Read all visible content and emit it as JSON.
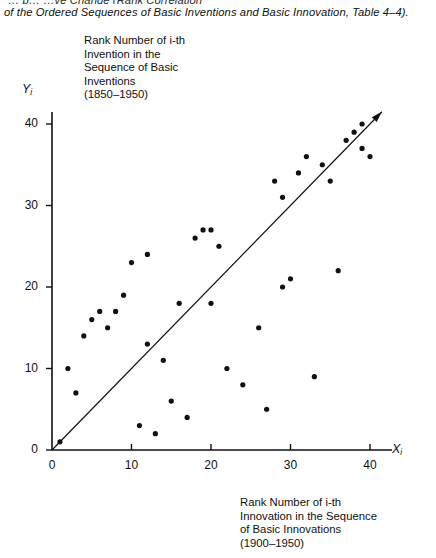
{
  "caption": {
    "line1": "of the Ordered Sequences of Basic Inventions and Basic Innovation, Table 4–4).",
    "line0_partial": "… p… …ve Change (Rank Correlation"
  },
  "y_axis": {
    "name": "Y",
    "name_sub": "i",
    "label_block": "Rank Number of i-th\nInvention in the\nSequence of Basic\nInventions\n(1850–1950)"
  },
  "x_axis": {
    "name": "X",
    "name_sub": "i",
    "label_block": "Rank Number of i-th\nInnovation in the Sequence\nof Basic Innovations\n(1900–1950)"
  },
  "chart_data": {
    "type": "scatter",
    "title": "",
    "xlabel": "Rank Number of i-th Innovation in the Sequence of Basic Innovations (1900-1950)",
    "ylabel": "Rank Number of i-th Invention in the Sequence of Basic Inventions (1850-1950)",
    "xlim": [
      0,
      43
    ],
    "ylim": [
      0,
      42
    ],
    "xticks": [
      0,
      10,
      20,
      30,
      40
    ],
    "yticks": [
      0,
      10,
      20,
      30,
      40
    ],
    "grid": false,
    "legend": null,
    "marker": "filled-circle",
    "marker_color": "#111111",
    "reference_line": {
      "name": "diagonal-trend-line",
      "from": [
        0,
        0
      ],
      "to": [
        41.5,
        41.5
      ],
      "arrow_at_end": true
    },
    "points": [
      [
        1,
        1
      ],
      [
        2,
        10
      ],
      [
        3,
        7
      ],
      [
        4,
        14
      ],
      [
        5,
        16
      ],
      [
        6,
        17
      ],
      [
        7,
        15
      ],
      [
        8,
        17
      ],
      [
        9,
        19
      ],
      [
        10,
        23
      ],
      [
        11,
        3
      ],
      [
        12,
        13
      ],
      [
        12,
        24
      ],
      [
        13,
        2
      ],
      [
        14,
        11
      ],
      [
        15,
        6
      ],
      [
        16,
        18
      ],
      [
        17,
        4
      ],
      [
        18,
        26
      ],
      [
        19,
        27
      ],
      [
        20,
        18
      ],
      [
        20,
        27
      ],
      [
        21,
        25
      ],
      [
        22,
        10
      ],
      [
        24,
        8
      ],
      [
        26,
        15
      ],
      [
        27,
        5
      ],
      [
        28,
        33
      ],
      [
        29,
        31
      ],
      [
        29,
        20
      ],
      [
        30,
        21
      ],
      [
        31,
        34
      ],
      [
        32,
        36
      ],
      [
        33,
        9
      ],
      [
        34,
        35
      ],
      [
        35,
        33
      ],
      [
        36,
        22
      ],
      [
        37,
        38
      ],
      [
        38,
        39
      ],
      [
        39,
        37
      ],
      [
        39,
        40
      ],
      [
        40,
        36
      ]
    ]
  }
}
